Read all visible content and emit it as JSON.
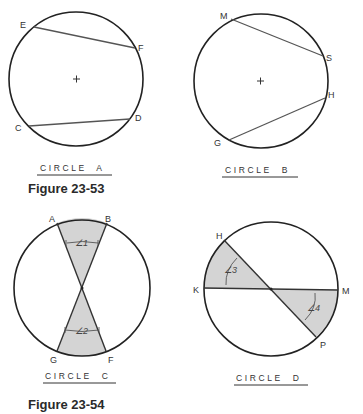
{
  "figures": [
    {
      "caption": "Figure 23-53",
      "circles": [
        {
          "title": "CIRCLE  A",
          "points": {
            "E": "E",
            "F": "F",
            "C": "C",
            "D": "D"
          },
          "chords": [
            "EF",
            "CD"
          ],
          "center_mark": "+"
        },
        {
          "title": "CIRCLE  B",
          "points": {
            "M": "M",
            "S": "S",
            "H": "H",
            "G": "G"
          },
          "chords": [
            "MS",
            "GH"
          ],
          "center_mark": "+"
        }
      ]
    },
    {
      "caption": "Figure 23-54",
      "circles": [
        {
          "title": "CIRCLE  C",
          "points": {
            "A": "A",
            "B": "B",
            "G": "G",
            "F": "F"
          },
          "angles": {
            "a1": "∠1",
            "a2": "∠2"
          },
          "lines": [
            "AF",
            "BG"
          ]
        },
        {
          "title": "CIRCLE  D",
          "points": {
            "H": "H",
            "K": "K",
            "M": "M",
            "P": "P"
          },
          "angles": {
            "a3": "∠3",
            "a4": "∠4"
          },
          "lines": [
            "KM",
            "HP"
          ]
        }
      ]
    }
  ],
  "colors": {
    "stroke": "#222222",
    "chord": "#555555",
    "shade": "#d4d4d4",
    "background": "#ffffff"
  }
}
